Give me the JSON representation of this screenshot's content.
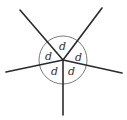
{
  "diagram": {
    "center": {
      "x": 63,
      "y": 60
    },
    "circle_radius": 24,
    "rays": [
      {
        "name": "upper-left",
        "end": {
          "x": 20,
          "y": 10
        }
      },
      {
        "name": "upper-right",
        "end": {
          "x": 102,
          "y": 8
        }
      },
      {
        "name": "right",
        "end": {
          "x": 122,
          "y": 73
        }
      },
      {
        "name": "down",
        "end": {
          "x": 63,
          "y": 115
        }
      },
      {
        "name": "left",
        "end": {
          "x": 6,
          "y": 72
        }
      }
    ],
    "angle_labels": [
      {
        "text": "d",
        "x": 59,
        "y": 50
      },
      {
        "text": "d",
        "x": 45,
        "y": 60
      },
      {
        "text": "d",
        "x": 75,
        "y": 61
      },
      {
        "text": "d",
        "x": 51,
        "y": 75
      },
      {
        "text": "d",
        "x": 68,
        "y": 75
      }
    ],
    "colors": {
      "ray": "#2a2a2a",
      "circle": "#7a7a7a",
      "label": "#333333"
    }
  }
}
